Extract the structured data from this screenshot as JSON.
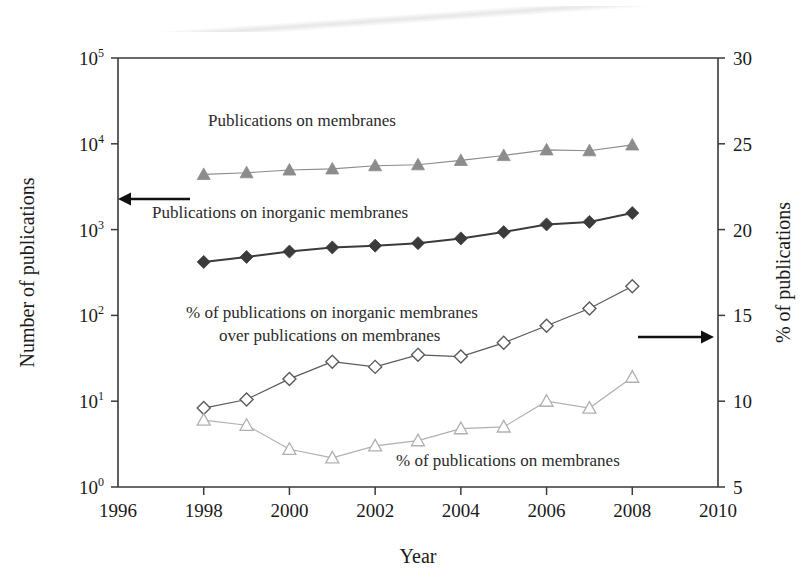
{
  "chart_data": {
    "type": "line",
    "title": "",
    "xlabel": "Year",
    "ylabel": "Number of publications",
    "y2label": "% of publications",
    "x": [
      1998,
      1999,
      2000,
      2001,
      2002,
      2003,
      2004,
      2005,
      2006,
      2007,
      2008
    ],
    "xlim": [
      1996,
      2010
    ],
    "xticks": [
      "1996",
      "1998",
      "2000",
      "2002",
      "2004",
      "2006",
      "2008",
      "2010"
    ],
    "xtick_values": [
      1996,
      1998,
      2000,
      2002,
      2004,
      2006,
      2008,
      2010
    ],
    "ylim": [
      1,
      100000
    ],
    "yscale": "log",
    "yticks": [
      "10^0",
      "10^1",
      "10^2",
      "10^3",
      "10^4",
      "10^5"
    ],
    "ytick_bases": [
      "10",
      "10",
      "10",
      "10",
      "10",
      "10"
    ],
    "ytick_exps": [
      "0",
      "1",
      "2",
      "3",
      "4",
      "5"
    ],
    "ytick_values": [
      1,
      10,
      100,
      1000,
      10000,
      100000
    ],
    "y2lim": [
      5,
      30
    ],
    "y2ticks": [
      "5",
      "10",
      "15",
      "20",
      "25",
      "30"
    ],
    "y2tick_values": [
      5,
      10,
      15,
      20,
      25,
      30
    ],
    "grid": false,
    "legend_position": "inline-annotations",
    "series": [
      {
        "name": "Publications on membranes",
        "axis": "left",
        "marker": "filled-triangle",
        "color": "#8c8c8c",
        "values": [
          4400,
          4600,
          4950,
          5100,
          5550,
          5700,
          6400,
          7300,
          8500,
          8300,
          9700
        ]
      },
      {
        "name": "Publications on inorganic membranes",
        "axis": "left",
        "marker": "filled-diamond",
        "color": "#3b3b3b",
        "values": [
          420,
          480,
          555,
          620,
          650,
          695,
          790,
          935,
          1150,
          1230,
          1560
        ]
      },
      {
        "name": "% of publications on inorganic membranes over publications on membranes",
        "axis": "right",
        "marker": "open-diamond",
        "color": "#5a5a5a",
        "values": [
          9.6,
          10.1,
          11.3,
          12.3,
          12.0,
          12.7,
          12.6,
          13.4,
          14.4,
          15.4,
          16.7
        ]
      },
      {
        "name": "% of publications on membranes",
        "axis": "right",
        "marker": "open-triangle",
        "color": "#b0b0b0",
        "values": [
          8.9,
          8.6,
          7.2,
          6.7,
          7.4,
          7.7,
          8.4,
          8.5,
          10.0,
          9.6,
          11.4
        ]
      }
    ],
    "annotations": [
      {
        "text": "Publications on membranes",
        "x_px": 208,
        "y_px": 126,
        "align": "start"
      },
      {
        "text": "Publications on inorganic membranes",
        "x_px": 152,
        "y_px": 218,
        "align": "start"
      },
      {
        "text": "% of publications on inorganic membranes",
        "x_px": 186,
        "y_px": 318,
        "align": "start"
      },
      {
        "text": "over publications on membranes",
        "x_px": 219,
        "y_px": 341,
        "align": "start"
      },
      {
        "text": "% of publications on membranes",
        "x_px": 396,
        "y_px": 466,
        "align": "start"
      }
    ],
    "arrows": [
      {
        "name": "left-axis-arrow",
        "direction": "left",
        "x1": 190,
        "x2": 118,
        "y": 199
      },
      {
        "name": "right-axis-arrow",
        "direction": "right",
        "x1": 638,
        "x2": 714,
        "y": 337
      }
    ]
  }
}
